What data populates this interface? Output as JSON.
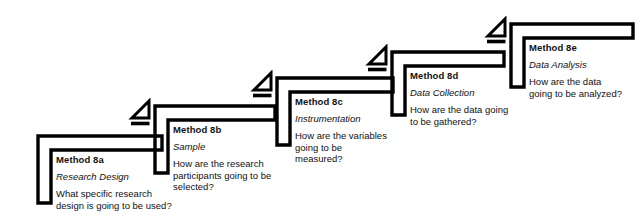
{
  "diagram": {
    "type": "staircase-flowchart",
    "title": "",
    "direction": "ascending-left-to-right",
    "stroke_color": "#000000",
    "text_color": "#111111",
    "background_color": "#ffffff",
    "steps": [
      {
        "id": "8a",
        "title": "Method 8a",
        "subtitle": "Research Design",
        "question": "What specific research design is going to be used?",
        "has_marker": false
      },
      {
        "id": "8b",
        "title": "Method 8b",
        "subtitle": "Sample",
        "question": "How are the research participants going to be selected?",
        "has_marker": true
      },
      {
        "id": "8c",
        "title": "Method 8c",
        "subtitle": "Instrumentation",
        "question": "How are the variables going to be measured?",
        "has_marker": true
      },
      {
        "id": "8d",
        "title": "Method 8d",
        "subtitle": "Data Collection",
        "question": "How are the data going to be gathered?",
        "has_marker": true
      },
      {
        "id": "8e",
        "title": "Method 8e",
        "subtitle": "Data Analysis",
        "question": "How are the data going to be analyzed?",
        "has_marker": true
      }
    ]
  }
}
